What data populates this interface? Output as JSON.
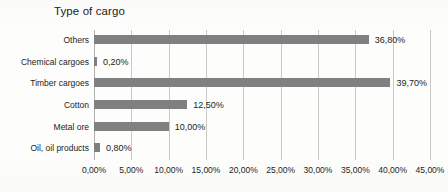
{
  "chart_data": {
    "type": "bar",
    "orientation": "horizontal",
    "title": "Type of cargo",
    "xlabel": "",
    "ylabel": "",
    "categories": [
      "Others",
      "Chemical cargoes",
      "Timber cargoes",
      "Cotton",
      "Metal ore",
      "Oil, oil products"
    ],
    "values": [
      36.8,
      0.2,
      39.7,
      12.5,
      10.0,
      0.8
    ],
    "data_labels": [
      "36,80%",
      "0,20%",
      "39,70%",
      "12,50%",
      "10,00%",
      "0,80%"
    ],
    "xlim": [
      0,
      45
    ],
    "xtick_values": [
      0,
      5,
      10,
      15,
      20,
      25,
      30,
      35,
      40,
      45
    ],
    "xtick_labels": [
      "0,00%",
      "5,00%",
      "10,00%",
      "15,00%",
      "20,00%",
      "25,00%",
      "30,00%",
      "35,00%",
      "40,00%",
      "45,00%"
    ],
    "grid": true,
    "grid_axis": "x",
    "legend": false,
    "series_color": "#808080",
    "gridline_color": "#c9c9c9",
    "background_color": "#ffffff",
    "text_color": "#1c1c1c"
  }
}
